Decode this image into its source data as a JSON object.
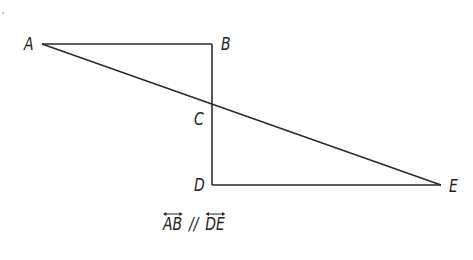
{
  "diagram": {
    "points": {
      "A": {
        "label": "A",
        "x": 42,
        "y": 44
      },
      "B": {
        "label": "B",
        "x": 212,
        "y": 44
      },
      "C": {
        "label": "C",
        "x": 212,
        "y": 107
      },
      "D": {
        "label": "D",
        "x": 212,
        "y": 185
      },
      "E": {
        "label": "E",
        "x": 441,
        "y": 185
      }
    },
    "segments": [
      {
        "from": "A",
        "to": "B"
      },
      {
        "from": "B",
        "to": "D"
      },
      {
        "from": "D",
        "to": "E"
      },
      {
        "from": "A",
        "to": "E"
      }
    ],
    "caption": {
      "line1": "AB",
      "parallel_symbol": "//",
      "line2": "DE"
    },
    "stroke_color": "#2a2a2a",
    "text_color": "#222222"
  }
}
